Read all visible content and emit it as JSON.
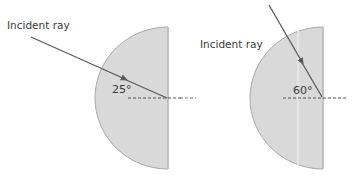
{
  "diagrams": [
    {
      "id": "left",
      "label": "Incident ray",
      "angle_label": "25°",
      "angle_deg": 25
    },
    {
      "id": "right",
      "label": "Incident ray",
      "angle_label": "60°",
      "angle_deg": 60
    }
  ],
  "colors": {
    "disc_fill": "#d9d9d9",
    "disc_edge": "#a8a8a8",
    "ray": "#5a5a5a",
    "normal": "#555555",
    "text": "#3a3a3a"
  }
}
